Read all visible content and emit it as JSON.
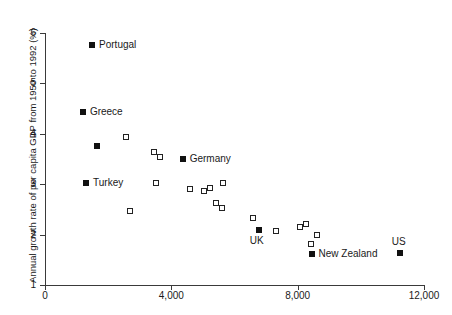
{
  "chart_data": {
    "type": "scatter",
    "title": "",
    "xlabel": "",
    "ylabel": "Annual growth rate of per capita GDP from 1950 to 1992 (%)",
    "xlim": [
      0,
      12000
    ],
    "ylim": [
      1,
      6
    ],
    "xticks": [
      "0",
      "4,000",
      "8,000",
      "12,000"
    ],
    "xtick_values": [
      0,
      4000,
      8000,
      12000
    ],
    "yticks": [
      "1",
      "2",
      "3",
      "4",
      "5",
      "6"
    ],
    "ytick_values": [
      1,
      2,
      3,
      4,
      5,
      6
    ],
    "grid": false,
    "legend": "none",
    "marker_styles": {
      "labelled": "filled-square",
      "unlabelled": "open-square"
    },
    "points": [
      {
        "label": "Portugal",
        "x": 1490,
        "y": 5.76,
        "style": "filled",
        "label_pos": "right"
      },
      {
        "label": "Greece",
        "x": 1200,
        "y": 4.43,
        "style": "filled",
        "label_pos": "right"
      },
      {
        "label": "Turkey",
        "x": 1300,
        "y": 3.02,
        "style": "filled",
        "label_pos": "right"
      },
      {
        "label": "Germany",
        "x": 4360,
        "y": 3.5,
        "style": "filled",
        "label_pos": "right"
      },
      {
        "label": "UK",
        "x": 6770,
        "y": 2.09,
        "style": "filled",
        "label_pos": "below"
      },
      {
        "label": "New Zealand",
        "x": 8440,
        "y": 1.62,
        "style": "filled",
        "label_pos": "right"
      },
      {
        "label": "US",
        "x": 11230,
        "y": 1.63,
        "style": "filled",
        "label_pos": "above"
      },
      {
        "label": "",
        "x": 1650,
        "y": 3.76,
        "style": "filled"
      },
      {
        "label": "",
        "x": 2560,
        "y": 3.93,
        "style": "open"
      },
      {
        "label": "",
        "x": 2690,
        "y": 2.47,
        "style": "open"
      },
      {
        "label": "",
        "x": 3450,
        "y": 3.63,
        "style": "open"
      },
      {
        "label": "",
        "x": 3640,
        "y": 3.53,
        "style": "open"
      },
      {
        "label": "",
        "x": 3510,
        "y": 3.02,
        "style": "open"
      },
      {
        "label": "",
        "x": 4590,
        "y": 2.9,
        "style": "open"
      },
      {
        "label": "",
        "x": 5020,
        "y": 2.86,
        "style": "open"
      },
      {
        "label": "",
        "x": 5240,
        "y": 2.92,
        "style": "open"
      },
      {
        "label": "",
        "x": 5640,
        "y": 3.02,
        "style": "open"
      },
      {
        "label": "",
        "x": 5420,
        "y": 2.63,
        "style": "open"
      },
      {
        "label": "",
        "x": 5600,
        "y": 2.53,
        "style": "open"
      },
      {
        "label": "",
        "x": 6580,
        "y": 2.32,
        "style": "open"
      },
      {
        "label": "",
        "x": 7300,
        "y": 2.08,
        "style": "open"
      },
      {
        "label": "",
        "x": 8060,
        "y": 2.15,
        "style": "open"
      },
      {
        "label": "",
        "x": 8260,
        "y": 2.22,
        "style": "open"
      },
      {
        "label": "",
        "x": 8610,
        "y": 2.0,
        "style": "open"
      },
      {
        "label": "",
        "x": 8420,
        "y": 1.82,
        "style": "open"
      }
    ]
  }
}
